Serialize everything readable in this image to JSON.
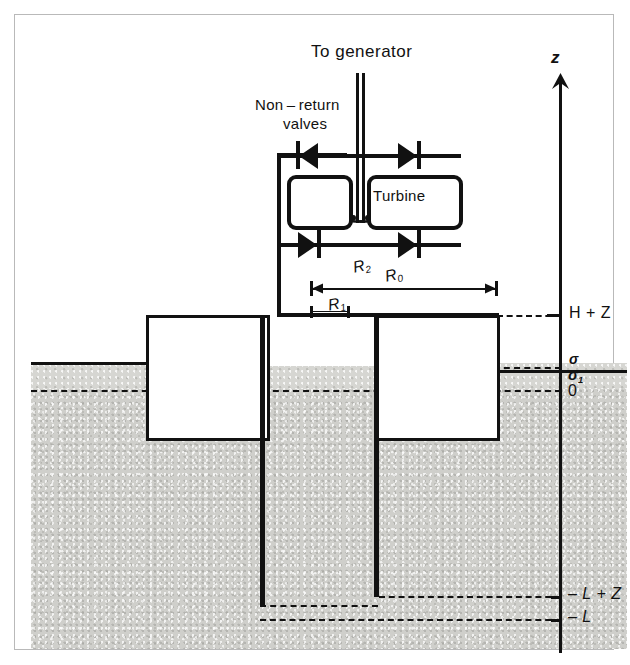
{
  "figure": {
    "type": "engineering-cross-section",
    "title_text": "To generator",
    "labels": {
      "to_generator": "To generator",
      "non_return_valves_line1": "Non – return",
      "non_return_valves_line2": "valves",
      "turbine": "Turbine",
      "axis_z": "z",
      "R2": "R",
      "R2_sub": "2",
      "R0": "R",
      "R0_sub": "0",
      "R1": "R",
      "R1_sub": "1",
      "level_H_plus_Z": "H + Z",
      "level_sigma": "σ",
      "level_sigma1": "σ",
      "level_sigma1_sub": "1",
      "level_zero": "0",
      "level_minus_L_plus_Z": "– L + Z",
      "level_minus_L": "– L"
    },
    "components": {
      "valve_count": 4,
      "chamber_count": 2,
      "caisson_count": 2,
      "shaft_count": 2
    },
    "colors": {
      "line": "#111111",
      "ground_fill": "#cfcfcb",
      "background": "#ffffff",
      "border": "#b9b9b9"
    }
  }
}
